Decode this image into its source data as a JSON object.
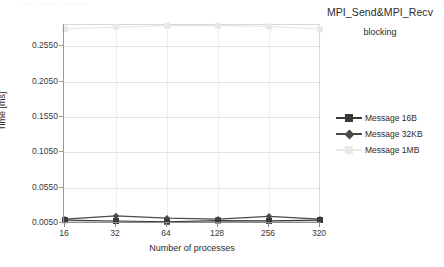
{
  "artifact": {
    "top_strip_text": "—— ——— ————"
  },
  "title": {
    "main": "MPI_Send&MPI_Recv",
    "sub": "blocking"
  },
  "axes": {
    "y_title": "Time [ms]",
    "x_title": "Number of processes"
  },
  "legend": {
    "items": [
      {
        "label": "Message 16B",
        "color": "#3a3a3a",
        "marker": "square"
      },
      {
        "label": "Message 32KB",
        "color": "#4a4a4a",
        "marker": "diamond"
      },
      {
        "label": "Message 1MB",
        "color": "#e8e8e8",
        "marker": "faint-square"
      }
    ]
  },
  "chart_data": {
    "type": "line",
    "title": "MPI_Send&MPI_Recv",
    "subtitle": "blocking",
    "xlabel": "Number of processes",
    "ylabel": "Time [ms]",
    "categories": [
      "16",
      "32",
      "64",
      "128",
      "256",
      "320"
    ],
    "x_ticklabels": [
      "16",
      "32",
      "64",
      "128",
      "256",
      "320"
    ],
    "y_ticklabels": [
      "0.0050",
      "0.0550",
      "0.1050",
      "0.1550",
      "0.2050",
      "0.2550"
    ],
    "y_tickvalues": [
      0.005,
      0.055,
      0.105,
      0.155,
      0.205,
      0.255
    ],
    "ylim": [
      0.005,
      0.285
    ],
    "grid": "horizontal",
    "legend_position": "right",
    "series": [
      {
        "name": "Message 16B",
        "color": "#3a3a3a",
        "marker": "square",
        "values": [
          0.009,
          0.0078,
          0.0068,
          0.0085,
          0.008,
          0.0092
        ]
      },
      {
        "name": "Message 32KB",
        "color": "#4a4a4a",
        "marker": "diamond",
        "values": [
          0.0105,
          0.015,
          0.0118,
          0.0105,
          0.0145,
          0.0105
        ]
      },
      {
        "name": "Message 1MB",
        "color": "#e8e8e8",
        "marker": "square",
        "values": [
          0.2795,
          0.282,
          0.284,
          0.284,
          0.283,
          0.279
        ]
      }
    ]
  }
}
